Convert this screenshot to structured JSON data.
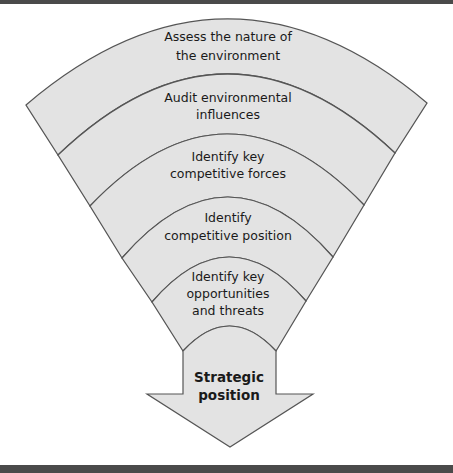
{
  "diagram": {
    "type": "funnel-to-arrow",
    "fill_color": "#e3e3e3",
    "stroke_color": "#555555",
    "frame_color": "#4a4a4a",
    "stages": [
      {
        "lines": [
          "Assess the nature of",
          "the environment"
        ]
      },
      {
        "lines": [
          "Audit environmental",
          "influences"
        ]
      },
      {
        "lines": [
          "Identify key",
          "competitive forces"
        ]
      },
      {
        "lines": [
          "Identify",
          "competitive position"
        ]
      },
      {
        "lines": [
          "Identify key",
          "opportunities",
          "and threats"
        ]
      }
    ],
    "output": {
      "lines": [
        "Strategic",
        "position"
      ]
    }
  }
}
